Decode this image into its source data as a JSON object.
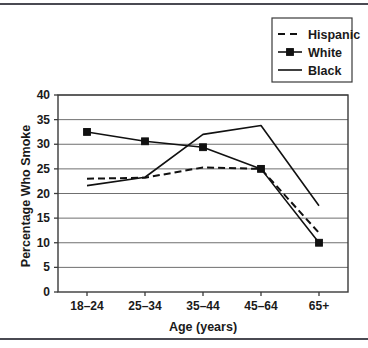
{
  "chart_data": {
    "type": "line",
    "title": "",
    "xlabel": "Age (years)",
    "ylabel": "Percentage Who Smoke",
    "categories": [
      "18–24",
      "25–34",
      "35–44",
      "45–64",
      "65+"
    ],
    "ylim": [
      0,
      40
    ],
    "ytick_step": 5,
    "yticks": [
      "0",
      "5",
      "10",
      "15",
      "20",
      "25",
      "30",
      "35",
      "40"
    ],
    "grid": "horizontal",
    "legend_position": "top-right",
    "series": [
      {
        "name": "Hispanic",
        "values": [
          23.0,
          23.2,
          25.3,
          25.0,
          12.0
        ],
        "style": "dashed",
        "marker": "none",
        "color": "#111111"
      },
      {
        "name": "White",
        "values": [
          32.5,
          30.6,
          29.4,
          25.0,
          10.0
        ],
        "style": "solid",
        "marker": "square",
        "color": "#111111"
      },
      {
        "name": "Black",
        "values": [
          21.6,
          23.3,
          32.0,
          33.8,
          17.5
        ],
        "style": "solid",
        "marker": "none",
        "color": "#111111"
      }
    ]
  },
  "legend": {
    "items": [
      {
        "label": "Hispanic"
      },
      {
        "label": "White"
      },
      {
        "label": "Black"
      }
    ]
  },
  "colors": {
    "ink": "#111111",
    "grid": "#6f6f6f",
    "axis": "#3a3a3a",
    "rule": "#4a4a52",
    "background": "#ffffff"
  }
}
